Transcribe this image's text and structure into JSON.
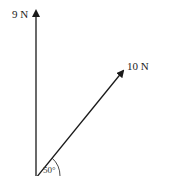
{
  "diagram": {
    "type": "force-vectors",
    "forces": [
      {
        "id": "vertical",
        "label": "9 N",
        "magnitude": 9,
        "unit": "N",
        "direction": "up"
      },
      {
        "id": "diagonal",
        "label": "10 N",
        "magnitude": 10,
        "unit": "N",
        "angle_deg": 50
      }
    ],
    "angle_label": "50°",
    "colors": {
      "line": "#1a1a1a",
      "text": "#222222"
    }
  }
}
